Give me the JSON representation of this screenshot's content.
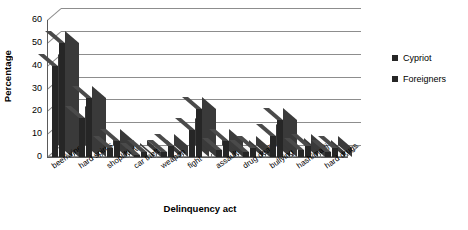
{
  "chart_data": {
    "type": "bar",
    "title": "",
    "xlabel": "Delinquency act",
    "ylabel": "Percentage",
    "ylim": [
      0,
      60
    ],
    "yticks": [
      0,
      10,
      20,
      30,
      40,
      50,
      60
    ],
    "grid": true,
    "legend_position": "right",
    "categories": [
      "beer/wine",
      "hard spirits",
      "shoplifting",
      "car theft",
      "weapon",
      "fight",
      "assault",
      "drug dealing",
      "bullying",
      "hash/marij",
      "hard drugs"
    ],
    "series": [
      {
        "name": "Cypriot",
        "color": "#262626",
        "values": [
          40,
          17,
          4,
          1,
          2,
          12,
          3,
          2,
          9,
          3,
          2
        ]
      },
      {
        "name": "Foreigners",
        "color": "#262626",
        "values": [
          50,
          26,
          7,
          2,
          5,
          21,
          7,
          4,
          16,
          5,
          4
        ]
      }
    ]
  },
  "legend": {
    "items": [
      {
        "label": "Cypriot"
      },
      {
        "label": "Foreigners"
      }
    ]
  }
}
